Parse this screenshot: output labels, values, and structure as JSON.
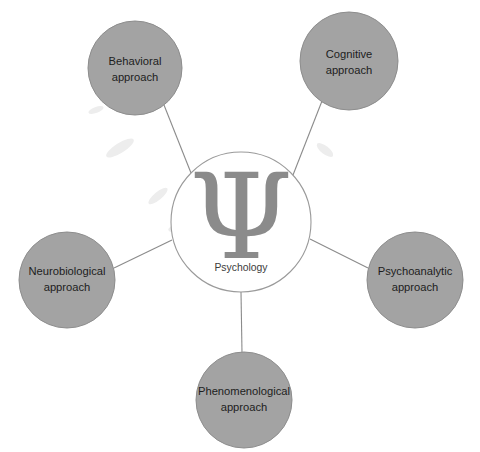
{
  "diagram": {
    "type": "hub-and-spoke",
    "background_color": "#ffffff",
    "node_fill_color": "#a3a3a3",
    "node_stroke_color": "#8d8d8d",
    "connector_color": "#8b8b8b",
    "center": {
      "label": "Psychology",
      "symbol": "Ψ",
      "symbol_name": "greek-letter-psi",
      "symbol_color": "#8b8b8b",
      "fill_color": "#ffffff",
      "stroke_color": "#9a9a9a",
      "cx": 241,
      "cy": 222,
      "r": 70
    },
    "nodes": [
      {
        "id": "behavioral",
        "line1": "Behavioral",
        "line2": "approach",
        "cx": 135,
        "cy": 68,
        "r": 47
      },
      {
        "id": "cognitive",
        "line1": "Cognitive",
        "line2": "approach",
        "cx": 349,
        "cy": 61,
        "r": 49
      },
      {
        "id": "psychoanalytic",
        "line1": "Psychoanalytic",
        "line2": "approach",
        "cx": 415,
        "cy": 280,
        "r": 48
      },
      {
        "id": "phenomenological",
        "line1": "Phenomenological",
        "line2": "approach",
        "cx": 244,
        "cy": 400,
        "r": 48
      },
      {
        "id": "neurobiological",
        "line1": "Neurobiological",
        "line2": "approach",
        "cx": 67,
        "cy": 280,
        "r": 48
      }
    ],
    "connectors": [
      {
        "id": "center-to-behavioral",
        "x1": 191,
        "y1": 173,
        "x2": 164,
        "y2": 105
      },
      {
        "id": "center-to-cognitive",
        "x1": 293,
        "y1": 175,
        "x2": 322,
        "y2": 101
      },
      {
        "id": "center-to-psychoanalytic",
        "x1": 310,
        "y1": 239,
        "x2": 368,
        "y2": 268
      },
      {
        "id": "center-to-phenomenological",
        "x1": 241,
        "y1": 292,
        "x2": 242,
        "y2": 353
      },
      {
        "id": "center-to-neurobiological",
        "x1": 172,
        "y1": 240,
        "x2": 114,
        "y2": 268
      }
    ]
  }
}
